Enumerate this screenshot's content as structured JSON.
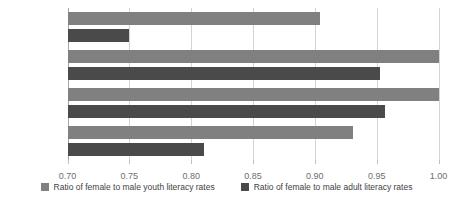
{
  "chart_data": {
    "type": "bar",
    "orientation": "horizontal",
    "title": "",
    "subtitle": "",
    "xlabel": "",
    "ylabel": "",
    "categories": [
      "South Asia",
      "East Asia",
      "Southeast Asia",
      "Pacific"
    ],
    "series": [
      {
        "name": "Ratio of female to male youth literacy rates",
        "color": "#808080",
        "values": [
          0.904,
          1.0,
          1.0,
          0.931
        ]
      },
      {
        "name": "Ratio of female to male adult literacy rates",
        "color": "#4a4a4a",
        "values": [
          0.75,
          0.953,
          0.957,
          0.81
        ]
      }
    ],
    "xlim": [
      0.7,
      1.0
    ],
    "xticks": [
      0.7,
      0.75,
      0.8,
      0.85,
      0.9,
      0.95,
      1.0
    ],
    "xtick_labels": [
      "0.70",
      "0.75",
      "0.80",
      "0.85",
      "0.90",
      "0.95",
      "1.00"
    ],
    "grid": true,
    "grid_axis": "x",
    "legend_position": "bottom"
  },
  "legend": {
    "items": [
      {
        "label": "Ratio of female to male youth literacy rates",
        "color": "#808080"
      },
      {
        "label": "Ratio of female to male adult literacy rates",
        "color": "#4a4a4a"
      }
    ]
  },
  "colors": {
    "youth_bar": "#808080",
    "adult_bar": "#4a4a4a",
    "gridline": "#d4d4d4",
    "axis": "#a6a6a6",
    "label_text": "#3f3f3f",
    "tick_text": "#6e6e6e",
    "background": "#ffffff"
  }
}
